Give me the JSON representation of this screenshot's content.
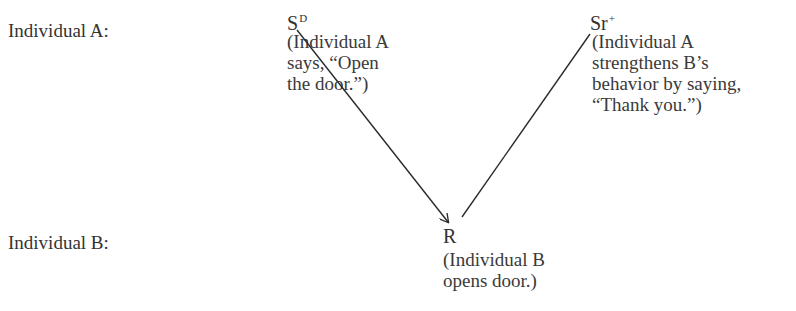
{
  "rows": [
    {
      "label": "Individual  A:"
    },
    {
      "label": "Individual  B:"
    }
  ],
  "nodes": {
    "sd": {
      "symbol": "S",
      "superscript": "D",
      "description": "(Individual A\nsays, “Open\nthe door.”)"
    },
    "sr": {
      "symbol": "Sr",
      "superscript": "+",
      "description": "(Individual A\nstrengthens B’s\nbehavior by saying,\n“Thank you.”)"
    },
    "r": {
      "symbol": "R",
      "superscript": "",
      "description": "(Individual B\nopens door.)"
    }
  },
  "edges": [
    {
      "from": "sd",
      "to": "r",
      "arrowhead": true
    },
    {
      "from": "r",
      "to": "sr",
      "arrowhead": false
    }
  ],
  "colors": {
    "ink": "#333333",
    "background": "#ffffff"
  }
}
